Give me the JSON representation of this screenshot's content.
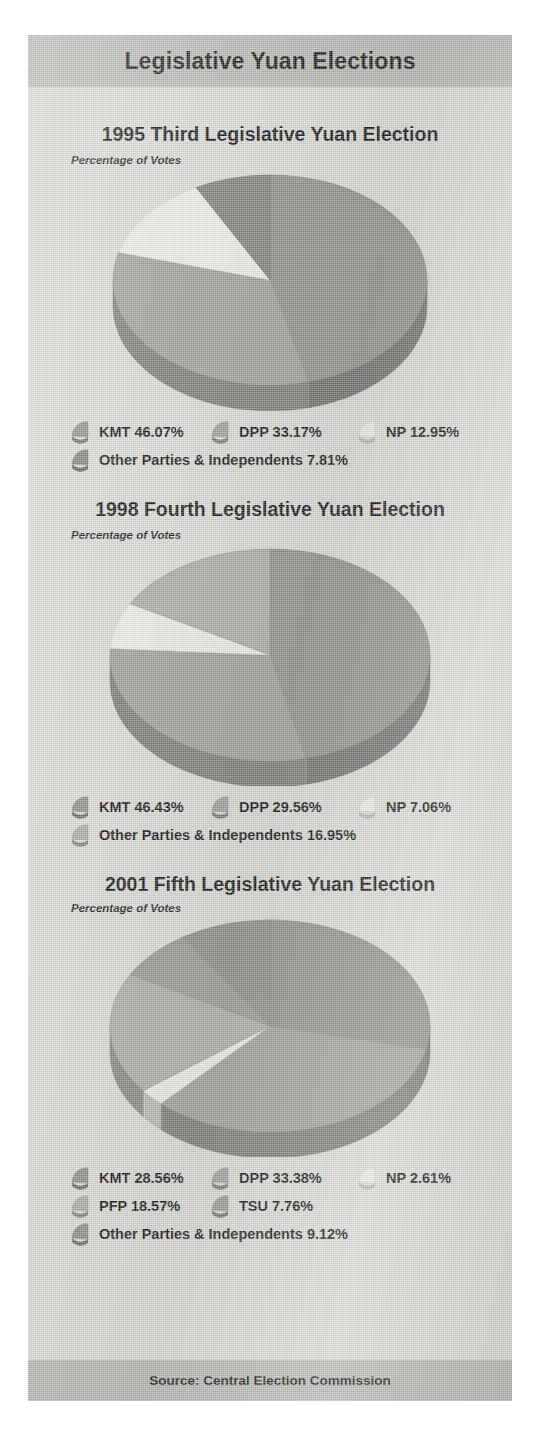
{
  "header": {
    "title": "Legislative Yuan Elections"
  },
  "footer": {
    "source": "Source: Central Election Commission"
  },
  "palette": {
    "page_bg": "#d8d9d4",
    "band": "#b6b7b2",
    "kmt": "#8d8e89",
    "dpp": "#9d9e99",
    "np": "#e9eae5",
    "other": "#7d7e79",
    "pfp": "#aaaba6",
    "tsu": "#96978f",
    "edge_dark": "#6a6b66"
  },
  "sections": [
    {
      "title": "1995 Third Legislative Yuan Election",
      "subtitle": "Percentage of Votes",
      "legend_rows": [
        [
          {
            "label": "KMT 46.07%",
            "color": "#8d8e89",
            "name": "kmt"
          },
          {
            "label": "DPP 33.17%",
            "color": "#9d9e99",
            "name": "dpp"
          },
          {
            "label": "NP 12.95%",
            "color": "#e9eae5",
            "name": "np"
          }
        ],
        [
          {
            "label": "Other Parties & Independents 7.81%",
            "color": "#7d7e79",
            "name": "other"
          }
        ]
      ]
    },
    {
      "title": "1998 Fourth Legislative Yuan Election",
      "subtitle": "Percentage of Votes",
      "legend_rows": [
        [
          {
            "label": "KMT 46.43%",
            "color": "#8d8e89",
            "name": "kmt"
          },
          {
            "label": "DPP 29.56%",
            "color": "#9d9e99",
            "name": "dpp"
          },
          {
            "label": "NP 7.06%",
            "color": "#e9eae5",
            "name": "np"
          }
        ],
        [
          {
            "label": "Other Parties & Independents 16.95%",
            "color": "#a9aaa5",
            "name": "other"
          }
        ]
      ]
    },
    {
      "title": "2001 Fifth Legislative Yuan Election",
      "subtitle": "Percentage of Votes",
      "legend_rows": [
        [
          {
            "label": "KMT 28.56%",
            "color": "#8d8e89",
            "name": "kmt"
          },
          {
            "label": "DPP 33.38%",
            "color": "#9d9e99",
            "name": "dpp"
          },
          {
            "label": "NP 2.61%",
            "color": "#e9eae5",
            "name": "np"
          }
        ],
        [
          {
            "label": "PFP 18.57%",
            "color": "#aaaba6",
            "name": "pfp"
          },
          {
            "label": "TSU 7.76%",
            "color": "#96978f",
            "name": "tsu"
          }
        ],
        [
          {
            "label": "Other Parties & Independents 9.12%",
            "color": "#8a8b86",
            "name": "other"
          }
        ]
      ]
    }
  ],
  "chart_data": [
    {
      "type": "pie",
      "title": "1995 Third Legislative Yuan Election",
      "subtitle": "Percentage of Votes",
      "ylabel": "",
      "xlabel": "",
      "unit": "percent",
      "labels": [
        "KMT",
        "DPP",
        "NP",
        "Other Parties & Independents"
      ],
      "values": [
        46.07,
        33.17,
        12.95,
        7.81
      ],
      "colors": [
        "#8d8e89",
        "#9d9e99",
        "#e9eae5",
        "#7d7e79"
      ],
      "legend": "bottom",
      "grid": false,
      "start_angle_deg": 0,
      "direction": "clockwise",
      "three_d": true
    },
    {
      "type": "pie",
      "title": "1998 Fourth Legislative Yuan Election",
      "subtitle": "Percentage of Votes",
      "ylabel": "",
      "xlabel": "",
      "unit": "percent",
      "labels": [
        "KMT",
        "DPP",
        "NP",
        "Other Parties & Independents"
      ],
      "values": [
        46.43,
        29.56,
        7.06,
        16.95
      ],
      "colors": [
        "#8d8e89",
        "#9d9e99",
        "#e9eae5",
        "#a9aaa5"
      ],
      "legend": "bottom",
      "grid": false,
      "start_angle_deg": 0,
      "direction": "clockwise",
      "three_d": true
    },
    {
      "type": "pie",
      "title": "2001 Fifth Legislative Yuan Election",
      "subtitle": "Percentage of Votes",
      "ylabel": "",
      "xlabel": "",
      "unit": "percent",
      "labels": [
        "KMT",
        "DPP",
        "NP",
        "PFP",
        "TSU",
        "Other Parties & Independents"
      ],
      "values": [
        28.56,
        33.38,
        2.61,
        18.57,
        7.76,
        9.12
      ],
      "colors": [
        "#8d8e89",
        "#9d9e99",
        "#e9eae5",
        "#aaaba6",
        "#96978f",
        "#8a8b86"
      ],
      "legend": "bottom",
      "grid": false,
      "start_angle_deg": 0,
      "direction": "clockwise",
      "three_d": true
    }
  ]
}
